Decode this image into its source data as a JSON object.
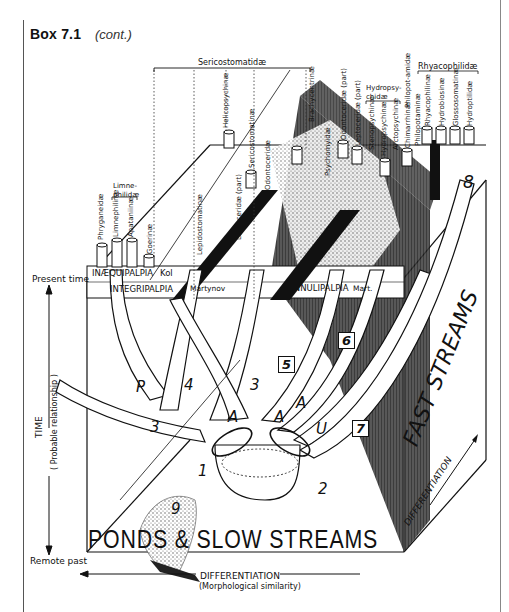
{
  "header": {
    "title": "Box 7.1",
    "subtitle": "(cont.)"
  },
  "axes": {
    "present": "Present time",
    "remote": "Remote past",
    "time_label": "TIME",
    "time_sub": "( Probable relationship )",
    "differentiation": "DIFFERENTIATION",
    "differentiation_sub": "(Morphological similarity)",
    "differentiation_right": "DIFFERENTIATION"
  },
  "habitats": {
    "ponds": "PONDS & SLOW STREAMS",
    "fast": "FAST STREAMS"
  },
  "bands": {
    "inaequipalpia": "INÆQUIPALPIA",
    "kol": "Kol",
    "integripalpia": "INTEGRIPALPIA",
    "martynov": "Martynov",
    "annulipalpia": "ANNULIPALPIA",
    "mart": "Mart."
  },
  "groups": {
    "sericostomatidae": "Sericostomatidæ",
    "limnephilidae": "Limne-philidæ",
    "hydropsychidae": "Hydropsy-chidæ",
    "rhyacophilidae": "Rhyacophilidæ",
    "philopotamidae": "Philopot-amidæ"
  },
  "taxa": [
    "Phryganeidæ",
    "Limnephilinæ",
    "Apataniinæ",
    "Goerinæ",
    "Lepidostomatinæ",
    "Helicopsychinæ",
    "Leptoceridæ (part)",
    "Sericostomatinæ",
    "Odontoceridæ",
    "Brachycentrinæ",
    "Psychomyidæ",
    "Odontoceridæ (part)",
    "Leptoceridæ (part)",
    "Stenopsychinæ",
    "Hydropsychinæ",
    "Arctopsychinæ",
    "Chimarrhinæ",
    "Philopotaminæ",
    "Rhyacophilinæ",
    "Hydrobiosinæ",
    "Glossosomatinæ",
    "Hydroptilidæ"
  ],
  "markers": {
    "n1": "1",
    "n2": "2",
    "n3a": "3",
    "n3b": "3",
    "n4": "4",
    "n5": "5",
    "n6": "6",
    "n7": "7",
    "n8": "8",
    "n9": "9",
    "p": "P",
    "a1": "A",
    "a2": "A",
    "a3": "A",
    "u": "U"
  }
}
